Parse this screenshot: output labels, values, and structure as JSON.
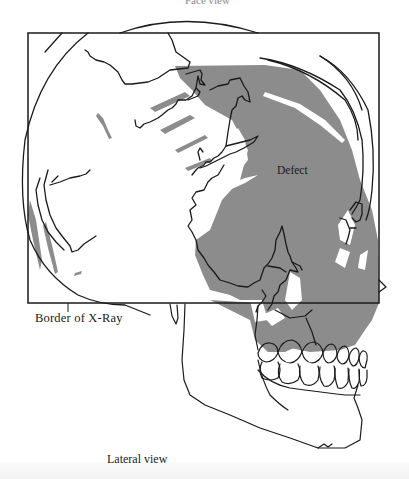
{
  "figure": {
    "top_caption": "Face view",
    "labels": {
      "border": "Border of X-Ray",
      "defect": "Defect"
    },
    "caption": "Lateral view",
    "colors": {
      "defect_fill": "#8c8c8c",
      "line": "#1a1a1a",
      "background": "#ffffff"
    }
  }
}
